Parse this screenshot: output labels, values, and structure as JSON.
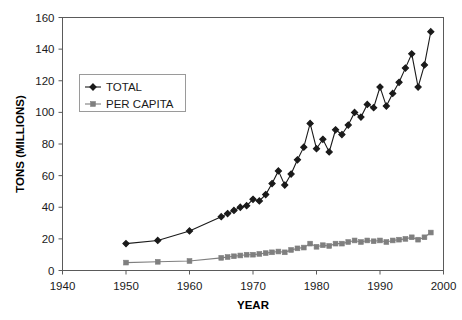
{
  "page": {
    "top_caption": "",
    "background": "#ffffff"
  },
  "chart_data": {
    "type": "line",
    "title": "",
    "xlabel": "YEAR",
    "ylabel": "TONS (MILLIONS)",
    "xlim": [
      1940,
      2000
    ],
    "ylim": [
      0,
      160
    ],
    "xticks": [
      1940,
      1950,
      1960,
      1970,
      1980,
      1990,
      2000
    ],
    "yticks": [
      0,
      20,
      40,
      60,
      80,
      100,
      120,
      140,
      160
    ],
    "grid": false,
    "legend_position": "upper left",
    "series": [
      {
        "name": "TOTAL",
        "color": "#1a1a1a",
        "marker": "diamond",
        "x": [
          1950,
          1955,
          1960,
          1965,
          1966,
          1967,
          1968,
          1969,
          1970,
          1971,
          1972,
          1973,
          1974,
          1975,
          1976,
          1977,
          1978,
          1979,
          1980,
          1981,
          1982,
          1983,
          1984,
          1985,
          1986,
          1987,
          1988,
          1989,
          1990,
          1991,
          1992,
          1993,
          1994,
          1995,
          1996,
          1997,
          1998
        ],
        "values": [
          17,
          19,
          25,
          34,
          36,
          38,
          40,
          41,
          45,
          44,
          48,
          55,
          63,
          54,
          61,
          70,
          78,
          93,
          77,
          83,
          75,
          89,
          86,
          92,
          100,
          97,
          105,
          103,
          116,
          104,
          112,
          119,
          128,
          137,
          116,
          130,
          151
        ]
      },
      {
        "name": "PER CAPITA",
        "color": "#7f7f7f",
        "marker": "square",
        "x": [
          1950,
          1955,
          1960,
          1965,
          1966,
          1967,
          1968,
          1969,
          1970,
          1971,
          1972,
          1973,
          1974,
          1975,
          1976,
          1977,
          1978,
          1979,
          1980,
          1981,
          1982,
          1983,
          1984,
          1985,
          1986,
          1987,
          1988,
          1989,
          1990,
          1991,
          1992,
          1993,
          1994,
          1995,
          1996,
          1997,
          1998
        ],
        "values": [
          5,
          5.5,
          6,
          8,
          8.5,
          9,
          9.5,
          10,
          10,
          10.5,
          11,
          11.5,
          12,
          11.5,
          13,
          14,
          14.5,
          17,
          15,
          16,
          15.5,
          17,
          17,
          18,
          19,
          18,
          19,
          18.5,
          19,
          18,
          19,
          19.5,
          20,
          21,
          19.5,
          21,
          24
        ]
      }
    ],
    "legend": [
      {
        "label": "TOTAL",
        "color": "#1a1a1a",
        "marker": "diamond"
      },
      {
        "label": "PER CAPITA",
        "color": "#7f7f7f",
        "marker": "square"
      }
    ]
  }
}
